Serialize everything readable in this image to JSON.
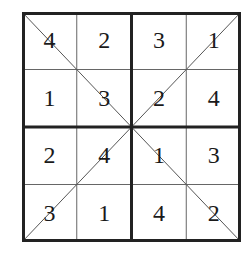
{
  "puzzle": {
    "type": "4x4 diagonal sudoku",
    "size": 4,
    "grid": [
      [
        "4",
        "2",
        "3",
        "1"
      ],
      [
        "1",
        "3",
        "2",
        "4"
      ],
      [
        "2",
        "4",
        "1",
        "3"
      ],
      [
        "3",
        "1",
        "4",
        "2"
      ]
    ],
    "diagonals": [
      "main",
      "anti"
    ],
    "colors": {
      "line": "#222222",
      "thin_line": "#555555",
      "text": "#1a1a1a",
      "background": "#ffffff"
    }
  }
}
